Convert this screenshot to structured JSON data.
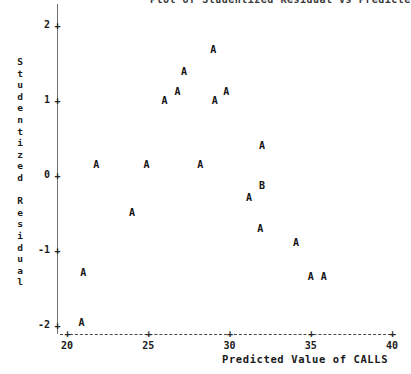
{
  "title": "Plot of Studentized Residual vs Predicted Value of CALLS",
  "chart_data": {
    "type": "scatter",
    "title": "",
    "xlabel": "Predicted Value of CALLS",
    "ylabel": "Studentized Residual",
    "ylabel_letters": [
      "S",
      "t",
      "u",
      "d",
      "e",
      "n",
      "t",
      "i",
      "z",
      "e",
      "d",
      "",
      "R",
      "e",
      "s",
      "i",
      "d",
      "u",
      "a",
      "l"
    ],
    "xlim": [
      20,
      40
    ],
    "ylim": [
      -2,
      2
    ],
    "xticks": [
      20,
      25,
      30,
      35,
      40
    ],
    "yticks": [
      2,
      1,
      0,
      -1,
      -2
    ],
    "xtick_labels": [
      "20",
      "25",
      "30",
      "35",
      "40"
    ],
    "ytick_labels": [
      "2",
      "1",
      "0",
      "-1",
      "-2"
    ],
    "grid": false,
    "legend": false,
    "marker_note": "Letter markers denote count of coincident observations: A = 1 obs, B = 2 obs",
    "points": [
      {
        "label": "A",
        "x": 21.0,
        "y": -1.3
      },
      {
        "label": "A",
        "x": 21.8,
        "y": 0.13
      },
      {
        "label": "A",
        "x": 20.9,
        "y": -1.97
      },
      {
        "label": "A",
        "x": 24.0,
        "y": -0.51
      },
      {
        "label": "A",
        "x": 24.9,
        "y": 0.13
      },
      {
        "label": "A",
        "x": 26.0,
        "y": 0.99
      },
      {
        "label": "A",
        "x": 26.8,
        "y": 1.11
      },
      {
        "label": "A",
        "x": 27.2,
        "y": 1.37
      },
      {
        "label": "A",
        "x": 28.2,
        "y": 0.13
      },
      {
        "label": "A",
        "x": 29.0,
        "y": 1.67
      },
      {
        "label": "A",
        "x": 29.1,
        "y": 0.99
      },
      {
        "label": "A",
        "x": 29.8,
        "y": 1.11
      },
      {
        "label": "A",
        "x": 32.0,
        "y": 0.39
      },
      {
        "label": "B",
        "x": 32.0,
        "y": -0.15
      },
      {
        "label": "A",
        "x": 31.2,
        "y": -0.31
      },
      {
        "label": "A",
        "x": 31.9,
        "y": -0.72
      },
      {
        "label": "A",
        "x": 34.1,
        "y": -0.91
      },
      {
        "label": "A",
        "x": 35.0,
        "y": -1.36
      },
      {
        "label": "A",
        "x": 35.8,
        "y": -1.36
      }
    ]
  }
}
